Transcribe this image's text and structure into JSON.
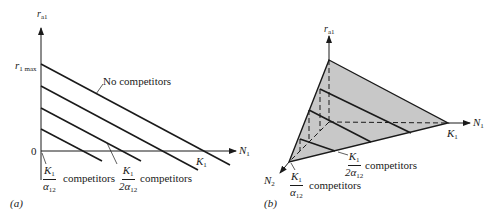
{
  "figure": {
    "panel_a": {
      "tag": "(a)",
      "y_axis_label": "r",
      "y_axis_sub": "a1",
      "y_max_label": "r",
      "y_max_sub": "1 max",
      "origin_label": "0",
      "x_axis_label": "N",
      "x_axis_sub": "1",
      "k_label": "K",
      "k_sub": "1",
      "no_competitors_label": "No competitors",
      "frac1": {
        "num": "K",
        "num_sub": "1",
        "den": "α",
        "den_sub": "12",
        "text": "competitors"
      },
      "frac2": {
        "num": "K",
        "num_sub": "1",
        "den": "2α",
        "den_sub": "12",
        "text": "competitors"
      }
    },
    "panel_b": {
      "tag": "(b)",
      "z_axis_label": "r",
      "z_axis_sub": "a1",
      "x_axis_label": "N",
      "x_axis_sub": "1",
      "n2_label": "N",
      "n2_sub": "2",
      "k_label": "K",
      "k_sub": "1",
      "frac1": {
        "num": "K",
        "num_sub": "1",
        "den": "α",
        "den_sub": "12",
        "text": "competitors"
      },
      "frac2": {
        "num": "K",
        "num_sub": "1",
        "den": "2α",
        "den_sub": "12",
        "text": "competitors"
      }
    },
    "colors": {
      "ink": "#1a1a1a",
      "surface_fill": "#c8c8c8"
    }
  }
}
